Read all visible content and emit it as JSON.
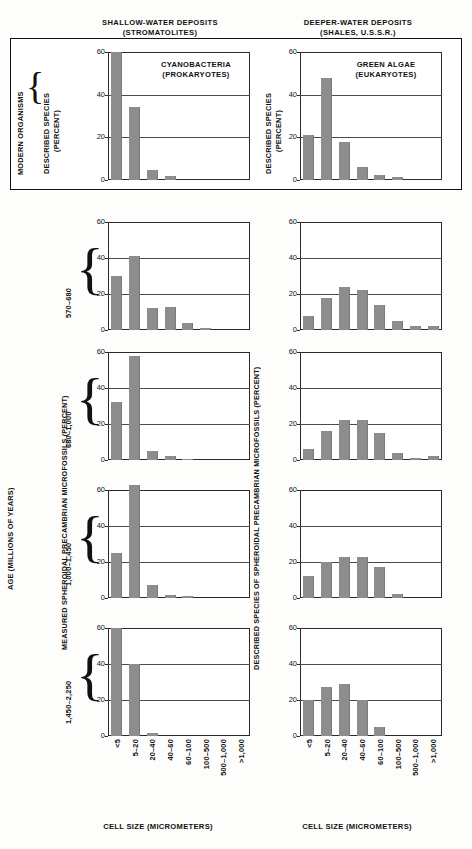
{
  "headers": {
    "left": "SHALLOW-WATER DEPOSITS\n(STROMATOLITES)",
    "left_line1": "SHALLOW-WATER DEPOSITS",
    "left_line2": "(STROMATOLITES)",
    "right_line1": "DEEPER-WATER DEPOSITS",
    "right_line2": "(SHALES, U.S.S.R.)"
  },
  "labels": {
    "modern_organisms": "MODERN ORGANISMS",
    "described_species_percent_l1": "DESCRIBED SPECIES",
    "described_species_percent_l2": "(PERCENT)",
    "age_axis": "AGE (MILLIONS OF YEARS)",
    "left_value_axis": "MEASURED SPHEROIDAL PRECAMBRIAN MICROFOSSILS (PERCENT)",
    "right_value_axis": "DESCRIBED SPECIES OF SPHEROIDAL PRECAMBRIAN MICROFOSSILS (PERCENT)",
    "xcaption": "CELL SIZE (MICROMETERS)",
    "cyanobacteria_l1": "CYANOBACTERIA",
    "cyanobacteria_l2": "(PROKARYOTES)",
    "greenalgae_l1": "GREEN ALGAE",
    "greenalgae_l2": "(EUKARYOTES)"
  },
  "colors": {
    "bar": "#8d8d8d",
    "axis": "#2a2a2a",
    "grid": "#4a4a4a",
    "background": "#fdfdfb"
  },
  "age_rows": [
    {
      "label": "570–680"
    },
    {
      "label": "680–1,000"
    },
    {
      "label": "1,000–1,450"
    },
    {
      "label": "1,450–2,250"
    }
  ],
  "yticks": [
    "60",
    "40",
    "20",
    "0"
  ],
  "chart_data": [
    {
      "type": "bar",
      "title": "CYANOBACTERIA (PROKARYOTES)",
      "panel": "modern-left",
      "column": "SHALLOW-WATER DEPOSITS (STROMATOLITES)",
      "xlabel": "CELL SIZE (MICROMETERS)",
      "ylabel": "DESCRIBED SPECIES (PERCENT)",
      "ylim": [
        0,
        60
      ],
      "yticks": [
        0,
        20,
        40,
        60
      ],
      "grid": true,
      "categories": [
        "<5",
        "5–20",
        "20–40",
        "40–60",
        "60–100",
        "100–500",
        "500–1,000",
        ">1,000"
      ],
      "values": [
        60,
        34,
        4.5,
        2,
        0,
        0,
        0,
        0
      ]
    },
    {
      "type": "bar",
      "title": "GREEN ALGAE (EUKARYOTES)",
      "panel": "modern-right",
      "column": "DEEPER-WATER DEPOSITS (SHALES, U.S.S.R.)",
      "xlabel": "CELL SIZE (MICROMETERS)",
      "ylabel": "DESCRIBED SPECIES (PERCENT)",
      "ylim": [
        0,
        60
      ],
      "yticks": [
        0,
        20,
        40,
        60
      ],
      "grid": true,
      "categories": [
        "<5",
        "5–20",
        "20–40",
        "40–60",
        "60–100",
        "100–500",
        "500–1,000",
        ">1,000"
      ],
      "values": [
        21,
        48,
        18,
        6,
        2.5,
        1.5,
        0,
        0
      ]
    },
    {
      "type": "bar",
      "title": "570–680 (shallow-water)",
      "panel": "age1-left",
      "xlabel": "CELL SIZE (MICROMETERS)",
      "ylabel": "MEASURED SPHEROIDAL PRECAMBRIAN MICROFOSSILS (PERCENT)",
      "ylim": [
        0,
        60
      ],
      "yticks": [
        0,
        20,
        40,
        60
      ],
      "grid": true,
      "categories": [
        "<5",
        "5–20",
        "20–40",
        "40–60",
        "60–100",
        "100–500",
        "500–1,000",
        ">1,000"
      ],
      "values": [
        30,
        41,
        12,
        13,
        4,
        1,
        0,
        0
      ]
    },
    {
      "type": "bar",
      "title": "570–680 (deeper-water)",
      "panel": "age1-right",
      "xlabel": "CELL SIZE (MICROMETERS)",
      "ylabel": "DESCRIBED SPECIES OF SPHEROIDAL PRECAMBRIAN MICROFOSSILS (PERCENT)",
      "ylim": [
        0,
        60
      ],
      "yticks": [
        0,
        20,
        40,
        60
      ],
      "grid": true,
      "categories": [
        "<5",
        "5–20",
        "20–40",
        "40–60",
        "60–100",
        "100–500",
        "500–1,000",
        ">1,000"
      ],
      "values": [
        8,
        18,
        24,
        22,
        14,
        5,
        2,
        2.5
      ]
    },
    {
      "type": "bar",
      "title": "680–1,000 (shallow-water)",
      "panel": "age2-left",
      "xlabel": "CELL SIZE (MICROMETERS)",
      "ylabel": "MEASURED SPHEROIDAL PRECAMBRIAN MICROFOSSILS (PERCENT)",
      "ylim": [
        0,
        60
      ],
      "yticks": [
        0,
        20,
        40,
        60
      ],
      "grid": true,
      "categories": [
        "<5",
        "5–20",
        "20–40",
        "40–60",
        "60–100",
        "100–500",
        "500–1,000",
        ">1,000"
      ],
      "values": [
        32,
        58,
        5,
        2,
        0.8,
        0,
        0,
        0
      ]
    },
    {
      "type": "bar",
      "title": "680–1,000 (deeper-water)",
      "panel": "age2-right",
      "xlabel": "CELL SIZE (MICROMETERS)",
      "ylabel": "DESCRIBED SPECIES OF SPHEROIDAL PRECAMBRIAN MICROFOSSILS (PERCENT)",
      "ylim": [
        0,
        60
      ],
      "yticks": [
        0,
        20,
        40,
        60
      ],
      "grid": true,
      "categories": [
        "<5",
        "5–20",
        "20–40",
        "40–60",
        "60–100",
        "100–500",
        "500–1,000",
        ">1,000"
      ],
      "values": [
        6,
        16,
        22,
        22,
        15,
        4,
        1,
        2
      ]
    },
    {
      "type": "bar",
      "title": "1,000–1,450 (shallow-water)",
      "panel": "age3-left",
      "xlabel": "CELL SIZE (MICROMETERS)",
      "ylabel": "MEASURED SPHEROIDAL PRECAMBRIAN MICROFOSSILS (PERCENT)",
      "ylim": [
        0,
        60
      ],
      "yticks": [
        0,
        20,
        40,
        60
      ],
      "grid": true,
      "categories": [
        "<5",
        "5–20",
        "20–40",
        "40–60",
        "60–100",
        "100–500",
        "500–1,000",
        ">1,000"
      ],
      "values": [
        25,
        63,
        7,
        1.5,
        1,
        0,
        0,
        0
      ]
    },
    {
      "type": "bar",
      "title": "1,000–1,450 (deeper-water)",
      "panel": "age3-right",
      "xlabel": "CELL SIZE (MICROMETERS)",
      "ylabel": "DESCRIBED SPECIES OF SPHEROIDAL PRECAMBRIAN MICROFOSSILS (PERCENT)",
      "ylim": [
        0,
        60
      ],
      "yticks": [
        0,
        20,
        40,
        60
      ],
      "grid": true,
      "categories": [
        "<5",
        "5–20",
        "20–40",
        "40–60",
        "60–100",
        "100–500",
        "500–1,000",
        ">1,000"
      ],
      "values": [
        12,
        20,
        23,
        23,
        17,
        2,
        0,
        0
      ]
    },
    {
      "type": "bar",
      "title": "1,450–2,250 (shallow-water)",
      "panel": "age4-left",
      "xlabel": "CELL SIZE (MICROMETERS)",
      "ylabel": "MEASURED SPHEROIDAL PRECAMBRIAN MICROFOSSILS (PERCENT)",
      "ylim": [
        0,
        60
      ],
      "yticks": [
        0,
        20,
        40,
        60
      ],
      "grid": true,
      "categories": [
        "<5",
        "5–20",
        "20–40",
        "40–60",
        "60–100",
        "100–500",
        "500–1,000",
        ">1,000"
      ],
      "values": [
        60,
        40,
        1.5,
        0,
        0,
        0,
        0,
        0
      ]
    },
    {
      "type": "bar",
      "title": "1,450–2,250 (deeper-water)",
      "panel": "age4-right",
      "xlabel": "CELL SIZE (MICROMETERS)",
      "ylabel": "DESCRIBED SPECIES OF SPHEROIDAL PRECAMBRIAN MICROFOSSILS (PERCENT)",
      "ylim": [
        0,
        60
      ],
      "yticks": [
        0,
        20,
        40,
        60
      ],
      "grid": true,
      "categories": [
        "<5",
        "5–20",
        "20–40",
        "40–60",
        "60–100",
        "100–500",
        "500–1,000",
        ">1,000"
      ],
      "values": [
        20,
        27,
        29,
        20,
        5,
        0,
        0,
        0
      ]
    }
  ]
}
